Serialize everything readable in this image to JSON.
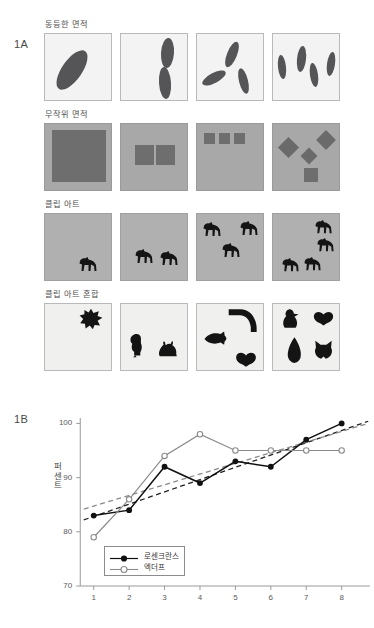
{
  "figure": {
    "panel_a_label": "1A",
    "panel_b_label": "1B"
  },
  "panel_a": {
    "conditions": [
      {
        "name": "equal-area",
        "title": "동등한 면적",
        "cell_style": "light",
        "counts": [
          1,
          2,
          3,
          4
        ]
      },
      {
        "name": "random-area",
        "title": "무작위 면적",
        "cell_style": "gray",
        "counts": [
          1,
          2,
          3,
          4
        ]
      },
      {
        "name": "clip-art",
        "title": "클립 아트",
        "cell_style": "midgray",
        "counts": [
          1,
          2,
          3,
          4
        ]
      },
      {
        "name": "clip-art-mixed",
        "title": "클립 아트 혼합",
        "cell_style": "paper",
        "counts": [
          1,
          2,
          3,
          4
        ]
      }
    ]
  },
  "chart_data": {
    "type": "line",
    "title": "",
    "xlabel": "",
    "ylabel": "퍼센트",
    "x": [
      1,
      2,
      3,
      4,
      5,
      6,
      7,
      8
    ],
    "xticklabels": [
      "1",
      "2",
      "3",
      "4",
      "5",
      "6",
      "7",
      "8"
    ],
    "yticklabels": [
      "70",
      "80",
      "90",
      "100"
    ],
    "yticks": [
      70,
      80,
      90,
      100
    ],
    "ylim": [
      70,
      101
    ],
    "xlim": [
      0.5,
      8.8
    ],
    "grid": false,
    "legend_position": "lower-left",
    "series": [
      {
        "name": "로센크란스",
        "marker": "filled-circle",
        "color": "#111111",
        "values": [
          83,
          84,
          92,
          89,
          93,
          92,
          97,
          100
        ]
      },
      {
        "name": "엑더프",
        "marker": "open-circle",
        "color": "#8a8a8a",
        "values": [
          79,
          86,
          94,
          98,
          95,
          95,
          95,
          95
        ]
      }
    ],
    "trendlines": [
      {
        "name": "trend-rosenkrantz",
        "style": "dashed",
        "color": "#222222",
        "start": [
          0.72,
          82.2
        ],
        "end": [
          8.75,
          100.4
        ]
      },
      {
        "name": "trend-ecduff",
        "style": "dashed",
        "color": "#8a8a8a",
        "start": [
          0.72,
          84.2
        ],
        "end": [
          8.75,
          100.0
        ]
      }
    ]
  }
}
